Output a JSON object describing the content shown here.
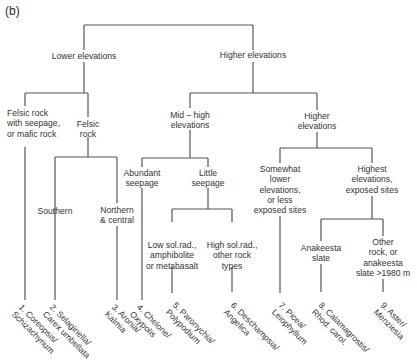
{
  "panel_label": "(b)",
  "nodes": {
    "lower": "Lower elevations",
    "higher": "Higher elevations",
    "felsic_seepage": "Felsic rock\nwith seepage,\nor mafic rock",
    "felsic_rock": "Felsic\nrock",
    "southern": "Southern",
    "northern": "Northern\n& central",
    "mid_high": "Mid – high\nelevations",
    "higher2": "Higher\nelevations",
    "abundant": "Abundant\nseepage",
    "little": "Little\nseepage",
    "low_sol": "Low sol.rad.,\namphibolite\nor metabasalt",
    "high_sol": "High sol.rad.,\nother rock\ntypes",
    "somewhat": "Somewhat\nlower\nelevations,\nor less\nexposed sites",
    "highest": "Highest\nelevations,\nexposed sites",
    "anakeesta": "Anakeesta\nslate",
    "other_rock": "Other\nrock, or\nanakeesta\nslate >1980 m"
  },
  "leaves": [
    "1. Coreopsis/\nSchizachyrium",
    "2. Selaginella/\nCarex umbellata",
    "3. Aronia/\nKalmia",
    "4. Chelone/\nOxypolis",
    "5. Paronychia/\nPolypodium",
    "6. Deschampsia/\nAngelica",
    "7. Picea/\nLeiophyllum",
    "8. Calamagrostis/\nRhod. carol.",
    "9. Aster/\nMenziesia"
  ]
}
